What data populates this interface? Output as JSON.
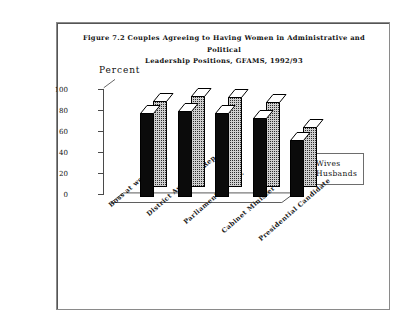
{
  "figure": {
    "title": "Figure 7.2   Couples Agreeing to Having Women in Administrative and Political\nLeadership Positions, GFAMS, 1992/93",
    "axis_label": "Percent"
  },
  "legend": {
    "entries": [
      {
        "label": "Wives",
        "swatch": "solid-black-square-icon"
      },
      {
        "label": "Husbands",
        "swatch": "checkered-square-icon"
      }
    ]
  },
  "yaxis": {
    "ticks": [
      "100",
      "80",
      "60",
      "40",
      "20",
      "0"
    ]
  },
  "chart_data": {
    "type": "bar",
    "title": "Figure 7.2   Couples Agreeing to Having Women in Administrative and Political Leadership Positions, GFAMS, 1992/93",
    "xlabel": "",
    "ylabel": "Percent",
    "ylim": [
      0,
      100
    ],
    "ytick_step": 20,
    "grid": false,
    "legend_position": "right",
    "three_d": true,
    "categories": [
      "Boss at work place",
      "District Assembly Rep.",
      "Parliamentary Rep.",
      "Cabinet Minister",
      "Presidential Candidate"
    ],
    "series": [
      {
        "name": "Wives",
        "values": [
          80,
          82,
          80,
          75,
          54
        ]
      },
      {
        "name": "Husbands",
        "values": [
          82,
          87,
          86,
          81,
          57
        ]
      }
    ]
  }
}
